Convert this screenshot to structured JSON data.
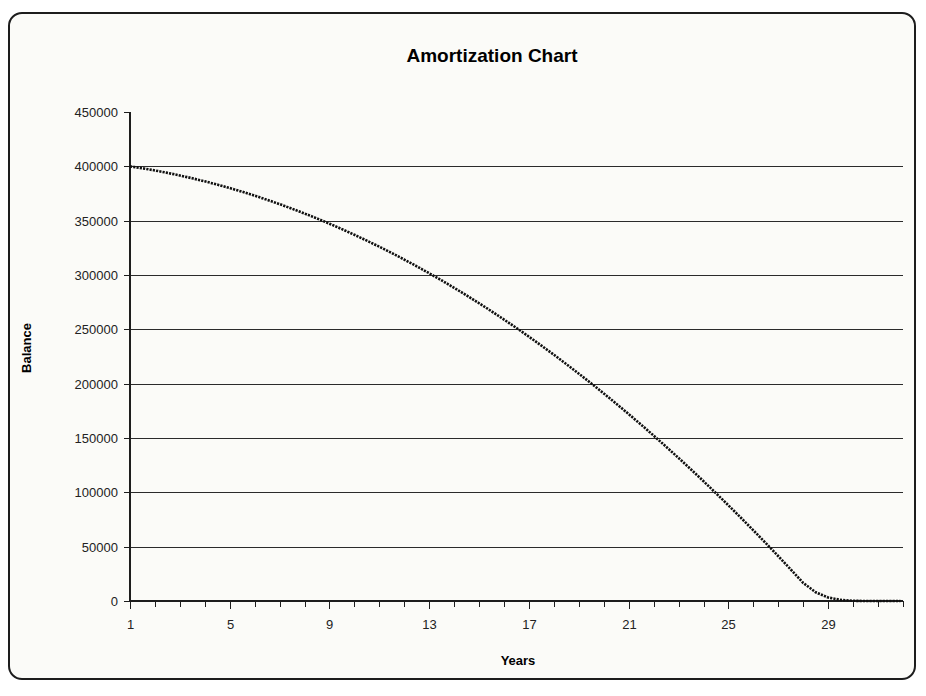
{
  "frame": {
    "border_color": "#1d1d1d",
    "background_color": "#fbfbf8"
  },
  "chart_data": {
    "type": "line",
    "title": "Amortization Chart",
    "xlabel": "Years",
    "ylabel": "Balance",
    "grid": "horizontal",
    "legend": "none",
    "line_color": "#101010",
    "line_style": "dotted-dense",
    "xlim": [
      1,
      32
    ],
    "ylim": [
      0,
      450000
    ],
    "y_ticks": [
      0,
      50000,
      100000,
      150000,
      200000,
      250000,
      300000,
      350000,
      400000,
      450000
    ],
    "y_tick_labels": [
      "0",
      "50000",
      "100000",
      "150000",
      "200000",
      "250000",
      "300000",
      "350000",
      "400000",
      "450000"
    ],
    "x_ticks": [
      1,
      2,
      3,
      4,
      5,
      6,
      7,
      8,
      9,
      10,
      11,
      12,
      13,
      14,
      15,
      16,
      17,
      18,
      19,
      20,
      21,
      22,
      23,
      24,
      25,
      26,
      27,
      28,
      29,
      30,
      31,
      32
    ],
    "x_tick_labels_shown": [
      "1",
      "5",
      "9",
      "13",
      "17",
      "21",
      "25",
      "29"
    ],
    "x_labeled_values": [
      1,
      5,
      9,
      13,
      17,
      21,
      25,
      29
    ],
    "series": [
      {
        "name": "Balance",
        "x": [
          1,
          2,
          3,
          4,
          5,
          6,
          7,
          8,
          9,
          10,
          11,
          12,
          13,
          14,
          15,
          16,
          17,
          18,
          19,
          20,
          21,
          22,
          23,
          24,
          25,
          26,
          27,
          28,
          29,
          30,
          31,
          31.9
        ],
        "values": [
          400000,
          394000,
          387500,
          380300,
          372500,
          364000,
          354800,
          344800,
          334000,
          322300,
          309600,
          295900,
          281000,
          265000,
          247700,
          229000,
          208800,
          187000,
          163500,
          138100,
          110700,
          81200,
          49300,
          15000,
          0,
          0,
          0,
          0,
          0,
          0,
          0,
          0
        ]
      }
    ],
    "series_plotted": {
      "name": "Balance",
      "x": [
        1,
        1.5,
        2,
        2.5,
        3,
        3.5,
        4,
        4.5,
        5,
        5.5,
        6,
        6.5,
        7,
        7.5,
        8,
        8.5,
        9,
        9.5,
        10,
        10.5,
        11,
        11.5,
        12,
        12.5,
        13,
        13.5,
        14,
        14.5,
        15,
        15.5,
        16,
        16.5,
        17,
        17.5,
        18,
        18.5,
        19,
        19.5,
        20,
        20.5,
        21,
        21.5,
        22,
        22.5,
        23,
        23.5,
        24,
        24.5,
        25,
        25.5,
        26,
        26.5,
        27,
        27.5,
        28,
        28.5,
        29,
        29.5,
        30,
        30.5,
        31,
        31.5,
        31.9
      ],
      "values": [
        400000,
        398200,
        396200,
        394000,
        391600,
        389000,
        386200,
        383200,
        380000,
        376600,
        373000,
        369200,
        365200,
        361000,
        356600,
        352000,
        347200,
        342200,
        337000,
        331600,
        326000,
        320200,
        314200,
        308000,
        301600,
        295000,
        288200,
        281200,
        274000,
        266600,
        259000,
        251200,
        243200,
        235000,
        226600,
        218000,
        209200,
        200200,
        191000,
        181600,
        172000,
        162200,
        152200,
        142000,
        131600,
        121000,
        110200,
        99200,
        88000,
        76600,
        65000,
        53200,
        41200,
        29000,
        16600,
        8000,
        3200,
        1000,
        200,
        0,
        0,
        0,
        0
      ]
    },
    "notes": {
      "start_balance": 400000,
      "end_balance": 0,
      "payoff_year_approx": 30
    }
  }
}
